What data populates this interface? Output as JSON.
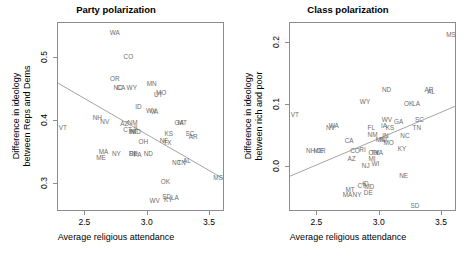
{
  "figure": {
    "background": "#ffffff",
    "label_color": "#6e6e6e",
    "frame_color": "#8c8c8c",
    "line_color": "#8c8c8c"
  },
  "chart_data": [
    {
      "type": "scatter",
      "panel": "left",
      "title": "Party polarization",
      "xlabel": "Average religious attendance",
      "ylabel_line1": "Difference in ideology",
      "ylabel_line2": "between Reps and Dems",
      "xlim": [
        2.28,
        3.62
      ],
      "ylim": [
        0.255,
        0.555
      ],
      "xticks": [
        2.5,
        3.0,
        3.5
      ],
      "xticklabels": [
        "2.5",
        "3.0",
        "3.5"
      ],
      "yticks": [
        0.3,
        0.4,
        0.5
      ],
      "yticklabels": [
        "0.3",
        "0.4",
        "0.5"
      ],
      "grid": false,
      "legend": "none",
      "point_style": "state-abbreviation-text",
      "fit_line": {
        "x0": 2.28,
        "y0": 0.4585,
        "x1": 3.62,
        "y1": 0.3055
      },
      "points": [
        {
          "label": "WA",
          "x": 2.735,
          "y": 0.5395
        },
        {
          "label": "CO",
          "x": 2.845,
          "y": 0.5015
        },
        {
          "label": "OR",
          "x": 2.735,
          "y": 0.4665
        },
        {
          "label": "NC",
          "x": 2.762,
          "y": 0.4525
        },
        {
          "label": "CA",
          "x": 2.785,
          "y": 0.4525
        },
        {
          "label": "WY",
          "x": 2.872,
          "y": 0.4525
        },
        {
          "label": "MN",
          "x": 3.032,
          "y": 0.4585
        },
        {
          "label": "UT",
          "x": 3.085,
          "y": 0.4405
        },
        {
          "label": "MO",
          "x": 3.108,
          "y": 0.4435
        },
        {
          "label": "ID",
          "x": 2.925,
          "y": 0.4215
        },
        {
          "label": "WV",
          "x": 3.028,
          "y": 0.4155
        },
        {
          "label": "VA",
          "x": 3.052,
          "y": 0.4145
        },
        {
          "label": "NH",
          "x": 2.595,
          "y": 0.4035
        },
        {
          "label": "NV",
          "x": 2.655,
          "y": 0.3975
        },
        {
          "label": "AZ",
          "x": 2.812,
          "y": 0.3945
        },
        {
          "label": "NM",
          "x": 2.878,
          "y": 0.3965
        },
        {
          "label": "GA",
          "x": 3.252,
          "y": 0.3955
        },
        {
          "label": "MT",
          "x": 3.278,
          "y": 0.3955
        },
        {
          "label": "VT",
          "x": 2.318,
          "y": 0.3885
        },
        {
          "label": "CT",
          "x": 2.838,
          "y": 0.3845
        },
        {
          "label": "IN",
          "x": 2.872,
          "y": 0.3825
        },
        {
          "label": "HI",
          "x": 2.882,
          "y": 0.3825
        },
        {
          "label": "MD",
          "x": 2.905,
          "y": 0.3825
        },
        {
          "label": "IL",
          "x": 2.912,
          "y": 0.3885
        },
        {
          "label": "KS",
          "x": 3.168,
          "y": 0.3795
        },
        {
          "label": "SC",
          "x": 3.338,
          "y": 0.3795
        },
        {
          "label": "AR",
          "x": 3.365,
          "y": 0.3735
        },
        {
          "label": "OH",
          "x": 2.965,
          "y": 0.3665
        },
        {
          "label": "NE",
          "x": 3.132,
          "y": 0.3675
        },
        {
          "label": "TX",
          "x": 3.158,
          "y": 0.3645
        },
        {
          "label": "MA",
          "x": 2.645,
          "y": 0.3505
        },
        {
          "label": "NY",
          "x": 2.748,
          "y": 0.3475
        },
        {
          "label": "RI",
          "x": 2.875,
          "y": 0.3475
        },
        {
          "label": "DE",
          "x": 2.885,
          "y": 0.3475
        },
        {
          "label": "PA",
          "x": 2.918,
          "y": 0.3455
        },
        {
          "label": "ND",
          "x": 3.005,
          "y": 0.3475
        },
        {
          "label": "ME",
          "x": 2.625,
          "y": 0.3415
        },
        {
          "label": "NC",
          "x": 3.232,
          "y": 0.3325
        },
        {
          "label": "TN",
          "x": 3.272,
          "y": 0.3325
        },
        {
          "label": "AL",
          "x": 3.315,
          "y": 0.3355
        },
        {
          "label": "MS",
          "x": 3.565,
          "y": 0.3095
        },
        {
          "label": "OK",
          "x": 3.142,
          "y": 0.3025
        },
        {
          "label": "SD",
          "x": 3.152,
          "y": 0.2785
        },
        {
          "label": "KY",
          "x": 3.165,
          "y": 0.2735
        },
        {
          "label": "LA",
          "x": 3.218,
          "y": 0.2765
        },
        {
          "label": "WV",
          "x": 3.055,
          "y": 0.2725
        }
      ]
    },
    {
      "type": "scatter",
      "panel": "right",
      "title": "Class polarization",
      "xlabel": "Average religious attendance",
      "ylabel_line1": "Difference in ideology",
      "ylabel_line2": "between rich and poor",
      "xlim": [
        2.28,
        3.62
      ],
      "ylim": [
        -0.072,
        0.232
      ],
      "xticks": [
        2.5,
        3.0,
        3.5
      ],
      "xticklabels": [
        "2.5",
        "3.0",
        "3.5"
      ],
      "yticks": [
        0.0,
        0.1,
        0.2
      ],
      "yticklabels": [
        "0.0",
        "0.1",
        "0.2"
      ],
      "grid": false,
      "legend": "none",
      "point_style": "state-abbreviation-text",
      "fit_line": {
        "x0": 2.28,
        "y0": -0.017,
        "x1": 3.62,
        "y1": 0.0965
      },
      "points": [
        {
          "label": "MS",
          "x": 3.572,
          "y": 0.2125
        },
        {
          "label": "ND",
          "x": 3.055,
          "y": 0.1235
        },
        {
          "label": "AR",
          "x": 3.395,
          "y": 0.1235
        },
        {
          "label": "AL",
          "x": 3.412,
          "y": 0.1205
        },
        {
          "label": "WY",
          "x": 2.882,
          "y": 0.1045
        },
        {
          "label": "OK",
          "x": 3.232,
          "y": 0.1015
        },
        {
          "label": "LA",
          "x": 3.292,
          "y": 0.1015
        },
        {
          "label": "VT",
          "x": 2.318,
          "y": 0.0835
        },
        {
          "label": "WV",
          "x": 3.058,
          "y": 0.0755
        },
        {
          "label": "GA",
          "x": 3.152,
          "y": 0.0735
        },
        {
          "label": "SC",
          "x": 3.318,
          "y": 0.0765
        },
        {
          "label": "NV",
          "x": 2.605,
          "y": 0.0625
        },
        {
          "label": "WA",
          "x": 2.632,
          "y": 0.0665
        },
        {
          "label": "IA",
          "x": 3.035,
          "y": 0.0665
        },
        {
          "label": "KS",
          "x": 3.082,
          "y": 0.0625
        },
        {
          "label": "TN",
          "x": 3.298,
          "y": 0.0625
        },
        {
          "label": "FL",
          "x": 2.932,
          "y": 0.0625
        },
        {
          "label": "NM",
          "x": 2.942,
          "y": 0.0515
        },
        {
          "label": "IN",
          "x": 3.045,
          "y": 0.0505
        },
        {
          "label": "NC",
          "x": 3.202,
          "y": 0.0495
        },
        {
          "label": "CA",
          "x": 2.755,
          "y": 0.0415
        },
        {
          "label": "MN",
          "x": 3.008,
          "y": 0.0435
        },
        {
          "label": "NJ",
          "x": 3.028,
          "y": 0.0435
        },
        {
          "label": "MO",
          "x": 3.072,
          "y": 0.0385
        },
        {
          "label": "NH",
          "x": 2.445,
          "y": 0.0255
        },
        {
          "label": "ME",
          "x": 2.508,
          "y": 0.0265
        },
        {
          "label": "OR",
          "x": 2.528,
          "y": 0.0255
        },
        {
          "label": "CO",
          "x": 2.802,
          "y": 0.0265
        },
        {
          "label": "RI",
          "x": 2.862,
          "y": 0.0275
        },
        {
          "label": "KY",
          "x": 3.178,
          "y": 0.0295
        },
        {
          "label": "OH",
          "x": 2.948,
          "y": 0.0235
        },
        {
          "label": "TX",
          "x": 2.962,
          "y": 0.0235
        },
        {
          "label": "VA",
          "x": 2.995,
          "y": 0.0225
        },
        {
          "label": "AZ",
          "x": 2.775,
          "y": 0.0125
        },
        {
          "label": "MI",
          "x": 2.938,
          "y": 0.0125
        },
        {
          "label": "WI",
          "x": 2.965,
          "y": 0.0055
        },
        {
          "label": "NJ",
          "x": 2.888,
          "y": 0.0015
        },
        {
          "label": "NE",
          "x": 3.192,
          "y": -0.0145
        },
        {
          "label": "ID",
          "x": 2.885,
          "y": -0.0265
        },
        {
          "label": "CT",
          "x": 2.855,
          "y": -0.0305
        },
        {
          "label": "MD",
          "x": 2.918,
          "y": -0.0315
        },
        {
          "label": "MT",
          "x": 2.762,
          "y": -0.0365
        },
        {
          "label": "DE",
          "x": 2.908,
          "y": -0.0415
        },
        {
          "label": "MA",
          "x": 2.742,
          "y": -0.0445
        },
        {
          "label": "NY",
          "x": 2.818,
          "y": -0.0445
        },
        {
          "label": "SD",
          "x": 3.282,
          "y": -0.0625
        }
      ]
    }
  ]
}
